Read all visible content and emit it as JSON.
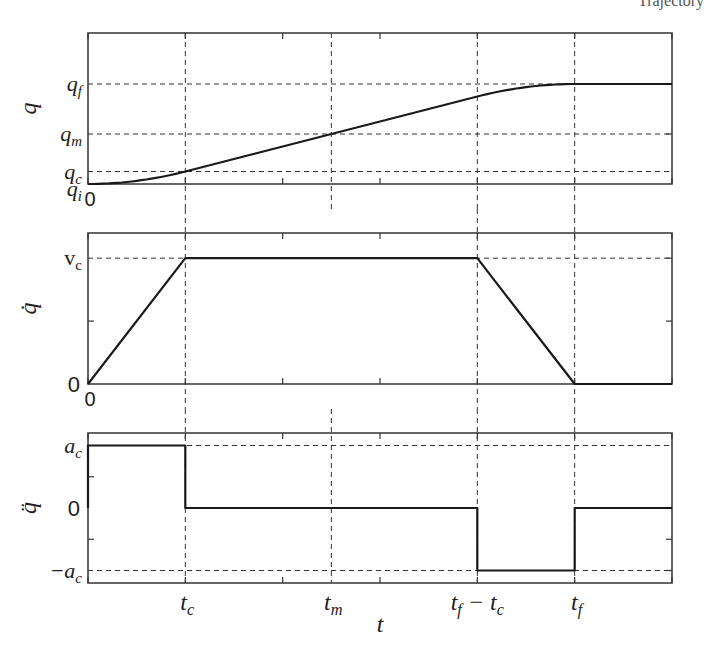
{
  "page": {
    "header_fragment": "Trajectory"
  },
  "figure": {
    "x_axis_label": "t",
    "x_markers": [
      {
        "name": "t_c",
        "value": 1,
        "label_main": "t",
        "label_sub": "c"
      },
      {
        "name": "t_m",
        "value": 2.5,
        "label_main": "t",
        "label_sub": "m"
      },
      {
        "name": "t_f-t_c",
        "value": 4,
        "label_main": "t",
        "label_sub": "f",
        "label_suffix": " − t",
        "label_suffix_sub": "c"
      },
      {
        "name": "t_f",
        "value": 5,
        "label_main": "t",
        "label_sub": "f"
      }
    ],
    "x_origin_label": "0",
    "xlim": [
      0,
      6
    ],
    "x_ticks": [
      0,
      1,
      2,
      3,
      4,
      5,
      6
    ],
    "colors": {
      "line": "#1a1a1a",
      "axes": "#333333",
      "dashed": "#333333",
      "background": "#ffffff"
    }
  },
  "chart_data": [
    {
      "type": "line",
      "title": "",
      "name": "position",
      "ylabel": "q",
      "xlabel": "",
      "xlim": [
        0,
        6
      ],
      "ylim": [
        0,
        1.51
      ],
      "grid": false,
      "y_markers": [
        {
          "name": "q_f",
          "value": 1.0,
          "label_main": "q",
          "label_sub": "f"
        },
        {
          "name": "q_m",
          "value": 0.5,
          "label_main": "q",
          "label_sub": "m"
        },
        {
          "name": "q_c",
          "value": 0.125,
          "label_main": "q",
          "label_sub": "c"
        },
        {
          "name": "q_i",
          "value": 0.0,
          "label_main": "q",
          "label_sub": "i"
        }
      ],
      "right_ticks": [
        0.5
      ],
      "series": [
        {
          "name": "q(t)",
          "x": [
            0,
            0.25,
            0.5,
            0.75,
            1,
            2,
            2.5,
            3,
            4,
            4.25,
            4.5,
            4.75,
            5,
            6
          ],
          "y": [
            0,
            0.0078,
            0.0313,
            0.0703,
            0.125,
            0.375,
            0.5,
            0.625,
            0.875,
            0.9297,
            0.9688,
            0.9922,
            1.0,
            1.0
          ]
        }
      ],
      "show_origin_label": true
    },
    {
      "type": "line",
      "title": "",
      "name": "velocity",
      "ylabel": "q̇",
      "xlabel": "",
      "xlim": [
        0,
        6
      ],
      "ylim": [
        0,
        0.3
      ],
      "grid": false,
      "y_markers": [
        {
          "name": "v_c",
          "value": 0.25,
          "label_main": "v",
          "label_sub": "c",
          "upright": true
        }
      ],
      "y_zero_label": "0",
      "left_ticks": [
        0.125
      ],
      "right_ticks": [
        0.125,
        0.25
      ],
      "series": [
        {
          "name": "qdot(t)",
          "x": [
            0,
            1,
            4,
            5,
            6
          ],
          "y": [
            0,
            0.25,
            0.25,
            0,
            0
          ]
        }
      ],
      "show_origin_label": true
    },
    {
      "type": "line",
      "title": "",
      "name": "acceleration",
      "ylabel": "q̈",
      "xlabel": "t",
      "xlim": [
        0,
        6
      ],
      "ylim": [
        -0.3,
        0.3
      ],
      "grid": false,
      "y_markers": [
        {
          "name": "a_c",
          "value": 0.25,
          "label_main": "a",
          "label_sub": "c"
        },
        {
          "name": "-a_c",
          "value": -0.25,
          "label_main": "−a",
          "label_sub": "c"
        }
      ],
      "y_zero_label": "0",
      "left_ticks": [
        0.125,
        -0.125
      ],
      "right_ticks": [
        -0.125,
        -0.25
      ],
      "series": [
        {
          "name": "qddot(t)",
          "x": [
            0,
            0,
            1,
            1,
            4,
            4,
            5,
            5,
            6
          ],
          "y": [
            0,
            0.25,
            0.25,
            0,
            0,
            -0.25,
            -0.25,
            0,
            0
          ]
        }
      ],
      "show_origin_label": false
    }
  ]
}
